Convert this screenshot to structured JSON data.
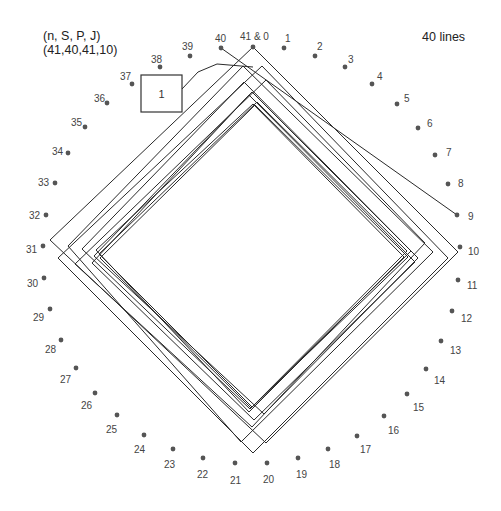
{
  "header": {
    "params_label": "(n, S, P, J)",
    "params_values": "(41,40,41,10)",
    "line_count": "40 lines"
  },
  "diagram": {
    "box_label": "1",
    "colors": {
      "line": "#2a2a2a",
      "dot": "#555555",
      "text": "#444444"
    },
    "points": [
      {
        "label": "41 & 0",
        "x": 253,
        "y": 47,
        "lx": 240,
        "ly": 40
      },
      {
        "label": "1",
        "x": 284,
        "y": 48,
        "lx": 285,
        "ly": 42
      },
      {
        "label": "2",
        "x": 315,
        "y": 56,
        "lx": 317,
        "ly": 50
      },
      {
        "label": "3",
        "x": 345,
        "y": 67,
        "lx": 348,
        "ly": 63
      },
      {
        "label": "4",
        "x": 372,
        "y": 84,
        "lx": 377,
        "ly": 80
      },
      {
        "label": "5",
        "x": 397,
        "y": 104,
        "lx": 404,
        "ly": 102
      },
      {
        "label": "6",
        "x": 418,
        "y": 128,
        "lx": 427,
        "ly": 127
      },
      {
        "label": "7",
        "x": 435,
        "y": 155,
        "lx": 446,
        "ly": 156
      },
      {
        "label": "8",
        "x": 448,
        "y": 184,
        "lx": 458,
        "ly": 187
      },
      {
        "label": "9",
        "x": 457,
        "y": 215,
        "lx": 468,
        "ly": 220
      },
      {
        "label": "10",
        "x": 460,
        "y": 247,
        "lx": 468,
        "ly": 255
      },
      {
        "label": "11",
        "x": 458,
        "y": 280,
        "lx": 467,
        "ly": 289
      },
      {
        "label": "12",
        "x": 452,
        "y": 311,
        "lx": 461,
        "ly": 322
      },
      {
        "label": "13",
        "x": 441,
        "y": 341,
        "lx": 450,
        "ly": 354
      },
      {
        "label": "14",
        "x": 426,
        "y": 369,
        "lx": 434,
        "ly": 384
      },
      {
        "label": "15",
        "x": 407,
        "y": 394,
        "lx": 413,
        "ly": 411
      },
      {
        "label": "16",
        "x": 384,
        "y": 416,
        "lx": 388,
        "ly": 434
      },
      {
        "label": "17",
        "x": 357,
        "y": 436,
        "lx": 360,
        "ly": 453
      },
      {
        "label": "18",
        "x": 328,
        "y": 449,
        "lx": 329,
        "ly": 468
      },
      {
        "label": "19",
        "x": 298,
        "y": 458,
        "lx": 296,
        "ly": 478
      },
      {
        "label": "20",
        "x": 267,
        "y": 463,
        "lx": 263,
        "ly": 483
      },
      {
        "label": "21",
        "x": 235,
        "y": 463,
        "lx": 230,
        "ly": 484
      },
      {
        "label": "22",
        "x": 203,
        "y": 458,
        "lx": 197,
        "ly": 478
      },
      {
        "label": "23",
        "x": 173,
        "y": 449,
        "lx": 164,
        "ly": 468
      },
      {
        "label": "24",
        "x": 144,
        "y": 435,
        "lx": 134,
        "ly": 453
      },
      {
        "label": "25",
        "x": 117,
        "y": 415,
        "lx": 106,
        "ly": 433
      },
      {
        "label": "26",
        "x": 95,
        "y": 393,
        "lx": 81,
        "ly": 409
      },
      {
        "label": "27",
        "x": 76,
        "y": 368,
        "lx": 60,
        "ly": 383
      },
      {
        "label": "28",
        "x": 61,
        "y": 340,
        "lx": 45,
        "ly": 353
      },
      {
        "label": "29",
        "x": 50,
        "y": 309,
        "lx": 33,
        "ly": 321
      },
      {
        "label": "30",
        "x": 44,
        "y": 278,
        "lx": 27,
        "ly": 287
      },
      {
        "label": "31",
        "x": 43,
        "y": 246,
        "lx": 26,
        "ly": 253
      },
      {
        "label": "32",
        "x": 46,
        "y": 215,
        "lx": 29,
        "ly": 219
      },
      {
        "label": "33",
        "x": 55,
        "y": 183,
        "lx": 38,
        "ly": 186
      },
      {
        "label": "34",
        "x": 68,
        "y": 153,
        "lx": 52,
        "ly": 155
      },
      {
        "label": "35",
        "x": 85,
        "y": 127,
        "lx": 71,
        "ly": 126
      },
      {
        "label": "36",
        "x": 107,
        "y": 103,
        "lx": 94,
        "ly": 102
      },
      {
        "label": "37",
        "x": 132,
        "y": 84,
        "lx": 120,
        "ly": 80
      },
      {
        "label": "38",
        "x": 160,
        "y": 67,
        "lx": 151,
        "ly": 63
      },
      {
        "label": "39",
        "x": 190,
        "y": 56,
        "lx": 182,
        "ly": 50
      },
      {
        "label": "40",
        "x": 221,
        "y": 48,
        "lx": 215,
        "ly": 42
      }
    ],
    "diamonds": [
      {
        "top": [
          253,
          47
        ],
        "right": [
          458,
          252
        ],
        "bottom": [
          266,
          443
        ],
        "left": [
          50,
          240
        ]
      },
      {
        "top": [
          262,
          66
        ],
        "right": [
          448,
          258
        ],
        "bottom": [
          253,
          453
        ],
        "left": [
          58,
          258
        ]
      },
      {
        "top": [
          243,
          66
        ],
        "right": [
          433,
          252
        ],
        "bottom": [
          241,
          442
        ],
        "left": [
          68,
          246
        ]
      },
      {
        "top": [
          266,
          80
        ],
        "right": [
          425,
          243
        ],
        "bottom": [
          252,
          427
        ],
        "left": [
          75,
          264
        ]
      },
      {
        "top": [
          244,
          82
        ],
        "right": [
          411,
          251
        ],
        "bottom": [
          250,
          409
        ],
        "left": [
          82,
          249
        ]
      },
      {
        "top": [
          252,
          92
        ],
        "right": [
          418,
          258
        ],
        "bottom": [
          264,
          414
        ],
        "left": [
          94,
          256
        ]
      },
      {
        "top": [
          249,
          95
        ],
        "right": [
          415,
          262
        ],
        "bottom": [
          254,
          420
        ],
        "left": [
          92,
          263
        ]
      },
      {
        "top": [
          257,
          102
        ],
        "right": [
          407,
          251
        ],
        "bottom": [
          252,
          407
        ],
        "left": [
          99,
          254
        ]
      },
      {
        "top": [
          253,
          104
        ],
        "right": [
          404,
          257
        ],
        "bottom": [
          249,
          412
        ],
        "left": [
          96,
          250
        ]
      },
      {
        "top": [
          255,
          105
        ],
        "right": [
          408,
          257
        ],
        "bottom": [
          251,
          408
        ],
        "left": [
          100,
          258
        ]
      }
    ],
    "extra_lines": [
      {
        "name": "line-40-to-9",
        "points": [
          [
            221,
            48
          ],
          [
            457,
            215
          ]
        ]
      }
    ],
    "box": {
      "x": 141,
      "y": 75,
      "w": 41,
      "h": 37
    },
    "box_connector": [
      [
        182,
        89
      ],
      [
        198,
        72
      ],
      [
        217,
        64
      ],
      [
        253,
        67
      ]
    ]
  }
}
